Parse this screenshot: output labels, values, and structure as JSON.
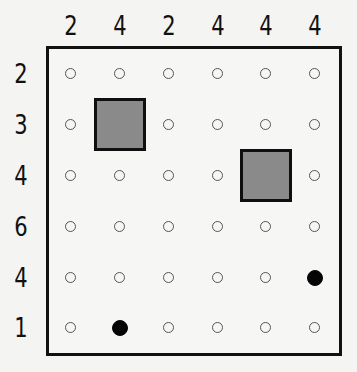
{
  "puzzle": {
    "column_clues": [
      "2",
      "4",
      "2",
      "4",
      "4",
      "4"
    ],
    "row_clues": [
      "2",
      "3",
      "4",
      "6",
      "4",
      "1"
    ],
    "grid_size": {
      "rows": 6,
      "cols": 6
    },
    "blocks": [
      {
        "row": 2,
        "col": 2
      },
      {
        "row": 3,
        "col": 5
      }
    ],
    "filled_dots": [
      {
        "row": 5,
        "col": 6
      },
      {
        "row": 6,
        "col": 2
      }
    ],
    "colors": {
      "block_fill": "#8a8a8a",
      "block_border": "#0f0f0f",
      "filled_dot": "#050505",
      "empty_dot_border": "#555555",
      "board_border": "#111111"
    }
  }
}
